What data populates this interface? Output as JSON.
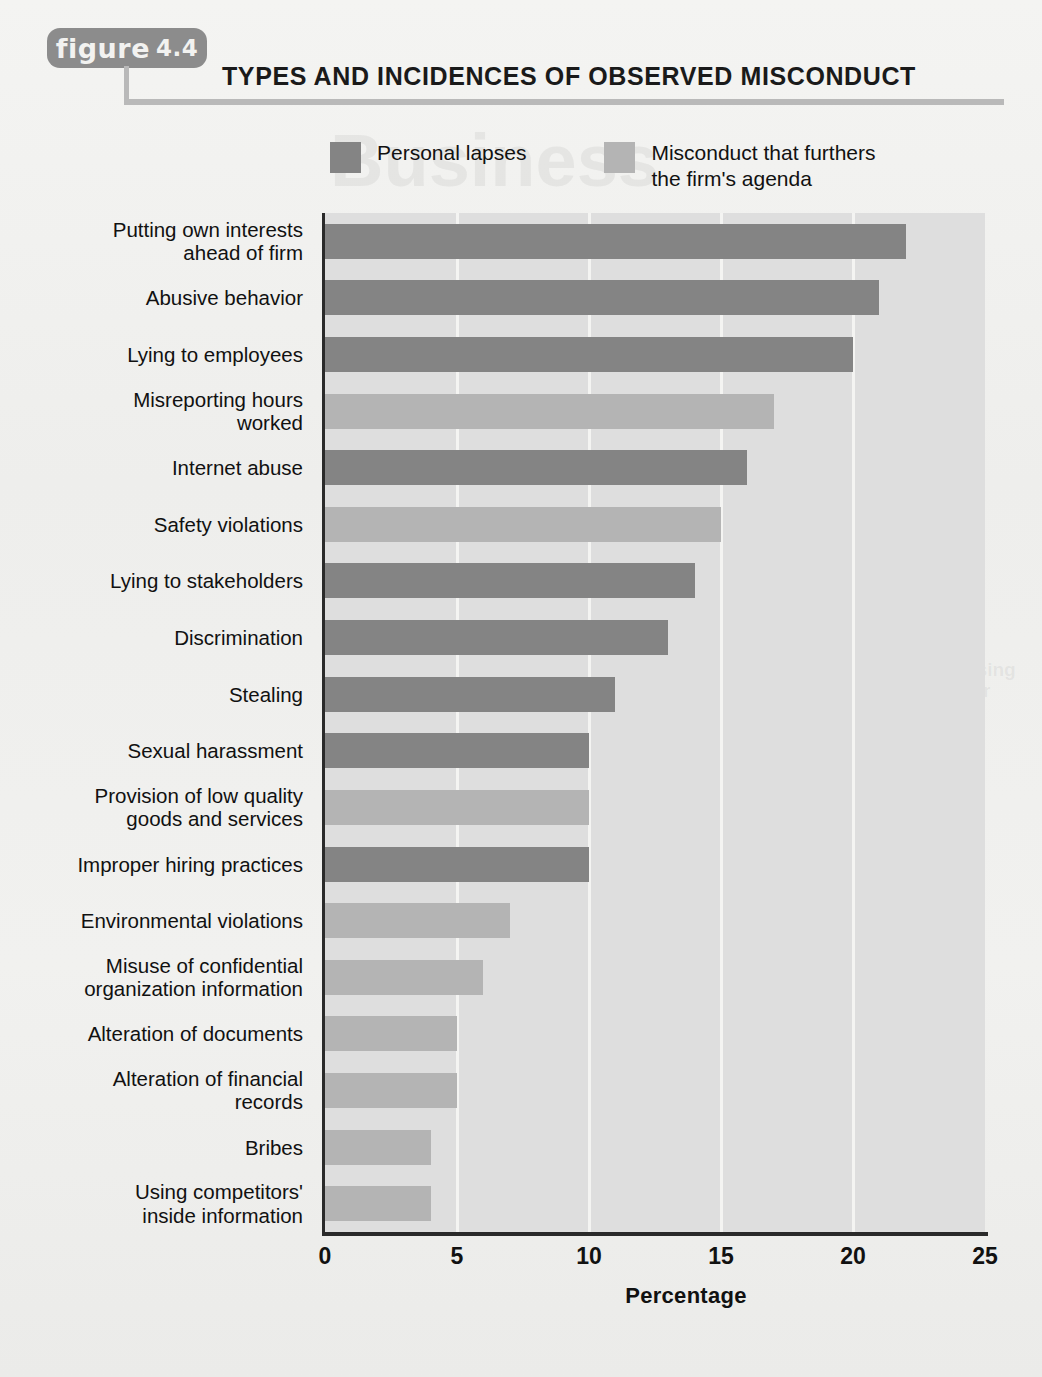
{
  "figure": {
    "badge_word": "figure",
    "badge_number": "4.4",
    "title": "TYPES AND INCIDENCES OF OBSERVED MISCONDUCT"
  },
  "legend": [
    {
      "label": "Personal lapses",
      "color": "#848484",
      "series": "personal"
    },
    {
      "label": "Misconduct that furthers\nthe firm's agenda",
      "color": "#b4b4b4",
      "series": "firm"
    }
  ],
  "colors": {
    "personal_lapses": "#848484",
    "firm_agenda": "#b4b4b4",
    "plot_background": "#dedede",
    "gridline": "#f4f4f2",
    "axis": "#2a2a2a",
    "badge": "#8c8c8c",
    "rule": "#b9b9b9",
    "page_background": "#f1f1ef"
  },
  "background_ghost_text": [
    {
      "text": "Business\nweek",
      "x": 330,
      "y": 120,
      "size": 74
    },
    {
      "text": "Improving Ethical Conduct\nUnit/ Plan",
      "x": 700,
      "y": 600,
      "size": 21
    },
    {
      "text": "training processes and more using\nthese processes to the behavior\nsimply the ethical conduct",
      "x": 700,
      "y": 660,
      "size": 19
    },
    {
      "text": "on the most\nlikely lead\nwith time\nthe entire\nresults the\nleast to the\nsuccess of\nthe firm",
      "x": 640,
      "y": 930,
      "size": 19
    }
  ],
  "chart_data": {
    "type": "bar",
    "orientation": "horizontal",
    "title": "TYPES AND INCIDENCES OF OBSERVED MISCONDUCT",
    "xlabel": "Percentage",
    "ylabel": "",
    "xlim": [
      0,
      25
    ],
    "xticks": [
      0,
      5,
      10,
      15,
      20,
      25
    ],
    "xtick_labels": [
      "0",
      "5",
      "10",
      "15",
      "20",
      "25"
    ],
    "grid": "vertical",
    "legend_position": "top",
    "categories": [
      "Putting own interests\nahead of firm",
      "Abusive behavior",
      "Lying to employees",
      "Misreporting hours\nworked",
      "Internet abuse",
      "Safety violations",
      "Lying to stakeholders",
      "Discrimination",
      "Stealing",
      "Sexual harassment",
      "Provision of low quality\ngoods and services",
      "Improper hiring practices",
      "Environmental violations",
      "Misuse of confidential\norganization information",
      "Alteration of documents",
      "Alteration of financial\nrecords",
      "Bribes",
      "Using competitors'\ninside information"
    ],
    "values": [
      22,
      21,
      20,
      17,
      16,
      15,
      14,
      13,
      11,
      10,
      10,
      10,
      7,
      6,
      5,
      5,
      4,
      4
    ],
    "series_of_bar": [
      "personal",
      "personal",
      "personal",
      "firm",
      "personal",
      "firm",
      "personal",
      "personal",
      "personal",
      "personal",
      "firm",
      "personal",
      "firm",
      "firm",
      "firm",
      "firm",
      "firm",
      "firm"
    ]
  }
}
